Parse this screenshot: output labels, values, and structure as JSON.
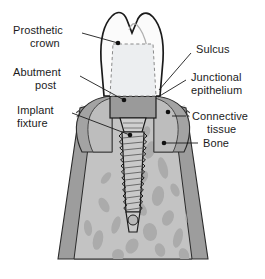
{
  "figure": {
    "background_color": "#ffffff",
    "width": 265,
    "height": 279
  },
  "labels": {
    "prosthetic_crown": "Prosthetic",
    "prosthetic_crown_line2": "crown",
    "abutment_post": "Abutment",
    "abutment_post_line2": "post",
    "implant_fixture": "Implant",
    "implant_fixture_line2": "fixture",
    "sulcus": "Sulcus",
    "junctional_epithelium": "Junctional",
    "junctional_epithelium_line2": "epithelium",
    "connective_tissue": "Connective",
    "connective_tissue_line2": "tissue",
    "bone": "Bone"
  },
  "colors": {
    "outline": "#1b1b1b",
    "crown_fill": "#fbfbfb",
    "abutment_ghost_fill": "#eceef0",
    "abutment_fill": "#9a9a9a",
    "gingiva_outer": "#8d8d8d",
    "gingiva_inner": "#b4b4b4",
    "connective_tissue_fill": "#a3a3a3",
    "cortical_bone": "#9d9d9d",
    "cancellous_bone": "#c3c3c3",
    "trabeculae": "#adadad",
    "implant_body": "#c9c9c9",
    "implant_thread_shade": "#9b9b9b",
    "leader_line": "#1b1b1b",
    "text": "#1b1b1b"
  },
  "structures": [
    {
      "name": "prosthetic-crown",
      "description": "Molar-shaped ceramic crown with cusped occlusal surface"
    },
    {
      "name": "abutment-post",
      "description": "Post shown as dashed ghost outline within crown"
    },
    {
      "name": "implant-fixture",
      "description": "Threaded titanium screw embedded in bone"
    },
    {
      "name": "sulcus",
      "description": "Gingival groove at crown margin"
    },
    {
      "name": "junctional-epithelium",
      "description": "Epithelial attachment to abutment"
    },
    {
      "name": "connective-tissue",
      "description": "Fibrous gingival tissue layer"
    },
    {
      "name": "bone",
      "description": "Cortical and cancellous alveolar bone"
    }
  ]
}
